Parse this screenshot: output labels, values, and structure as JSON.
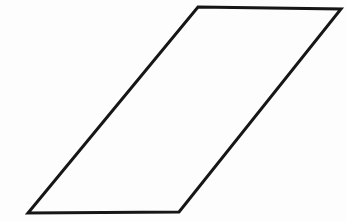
{
  "figure": {
    "shape": "parallelogram",
    "vertices": [
      [
        198,
        7
      ],
      [
        341,
        9
      ],
      [
        179,
        212
      ],
      [
        28,
        213
      ]
    ],
    "stroke_color": "#161616",
    "stroke_width": 3,
    "fill": "none",
    "background_color": "#fdfdfd",
    "canvas_width": 346,
    "canvas_height": 222
  }
}
